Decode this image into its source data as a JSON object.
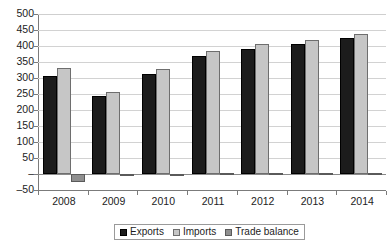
{
  "chart_data": {
    "type": "bar",
    "title": "",
    "subtitle": "",
    "xlabel": "",
    "ylabel": "",
    "categories": [
      "2008",
      "2009",
      "2010",
      "2011",
      "2012",
      "2013",
      "2014"
    ],
    "series": [
      {
        "name": "Exports",
        "color": "#1c1c1c",
        "values": [
          305,
          245,
          313,
          370,
          390,
          405,
          425
        ]
      },
      {
        "name": "Imports",
        "color": "#c6c6c6",
        "values": [
          330,
          255,
          328,
          385,
          405,
          418,
          438
        ]
      },
      {
        "name": "Trade balance",
        "color": "#8f8f8f",
        "values": [
          -25,
          -3,
          -2,
          2,
          2,
          2,
          2
        ]
      }
    ],
    "ylim": [
      -50,
      500
    ],
    "yticks": [
      -50,
      0,
      50,
      100,
      150,
      200,
      250,
      300,
      350,
      400,
      450,
      500
    ],
    "ytick_labels": [
      "–50",
      "–",
      "50",
      "100",
      "150",
      "200",
      "250",
      "300",
      "350",
      "400",
      "450",
      "500"
    ],
    "grid": true,
    "legend_position": "bottom"
  },
  "legend": {
    "items": [
      {
        "label": "Exports"
      },
      {
        "label": "Imports"
      },
      {
        "label": "Trade balance"
      }
    ]
  }
}
